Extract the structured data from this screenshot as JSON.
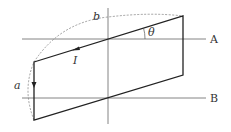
{
  "diagram": {
    "labels": {
      "axis_a": "A",
      "axis_b": "B",
      "angle": "θ",
      "current": "I",
      "side_a": "a",
      "side_b": "b"
    },
    "colors": {
      "loop": "#222222",
      "axes": "#777777",
      "arc": "#888888"
    }
  }
}
